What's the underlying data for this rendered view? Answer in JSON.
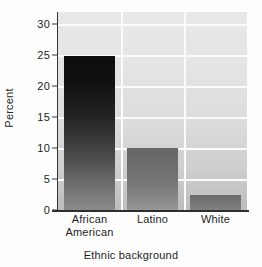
{
  "chart_data": {
    "type": "bar",
    "title": "",
    "subtitle": "",
    "xlabel": "Ethnic background",
    "ylabel": "Percent",
    "categories": [
      "African American",
      "Latino",
      "White"
    ],
    "category_lines": [
      [
        "African",
        "American"
      ],
      [
        "Latino",
        ""
      ],
      [
        "White",
        ""
      ]
    ],
    "values": [
      24.9,
      10.0,
      2.5
    ],
    "series": [
      {
        "name": "Percent",
        "values": [
          24.9,
          10.0,
          2.5
        ]
      }
    ],
    "ylim": [
      0,
      32
    ],
    "xlim_categories": 3,
    "yticks": [
      0,
      5,
      10,
      15,
      20,
      25,
      30
    ],
    "ytick_labels": [
      "0",
      "5",
      "10",
      "15",
      "20",
      "25",
      "30"
    ],
    "grid": {
      "horizontal": true,
      "vertical": true,
      "color": "#fbfbfb"
    },
    "legend": {
      "visible": false,
      "position": "none"
    },
    "annotations": [],
    "colors": {
      "plot_background_top": "#e8e8e8",
      "plot_background_bottom": "#bdbdbd",
      "gridline": "#fbfbfb",
      "axis": "#2e2e2e",
      "text": "#1d1d1d",
      "bar_african_american_top": "#0d0d0d",
      "bar_african_american_bottom": "#8a8a8a",
      "bar_latino_top": "#676767",
      "bar_latino_bottom": "#989898",
      "bar_white_top": "#6a6a6a",
      "bar_white_bottom": "#818181"
    }
  }
}
